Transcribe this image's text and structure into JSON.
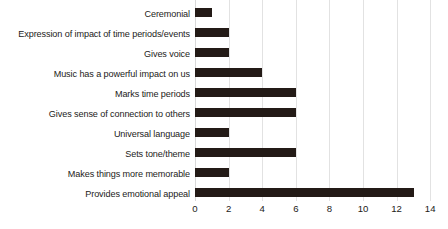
{
  "chart_data": {
    "type": "bar",
    "orientation": "horizontal",
    "title": "",
    "xlabel": "",
    "ylabel": "",
    "xlim": [
      0,
      14
    ],
    "xticks": [
      0,
      2,
      4,
      6,
      8,
      10,
      12,
      14
    ],
    "grid": "vertical",
    "legend": "none",
    "bar_color": "#231a16",
    "background_color": "#ffffff",
    "gridline_color": "#e2e2e2",
    "categories": [
      "Ceremonial",
      "Expression of impact of time periods/events",
      "Gives voice",
      "Music has a powerful impact on us",
      "Marks time periods",
      "Gives sense of connection to others",
      "Universal language",
      "Sets tone/theme",
      "Makes things more memorable",
      "Provides emotional appeal"
    ],
    "values": [
      1,
      2,
      2,
      4,
      6,
      6,
      2,
      6,
      2,
      13
    ]
  }
}
